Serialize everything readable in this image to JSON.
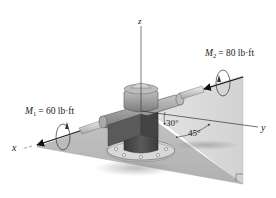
{
  "figure": {
    "axes": {
      "x_label": "x",
      "y_label": "y",
      "z_label": "z"
    },
    "moments": [
      {
        "symbol": "M",
        "subscript": "1",
        "equals": "= 60 lb·ft",
        "value": 60,
        "unit": "lb·ft",
        "axis": "x"
      },
      {
        "symbol": "M",
        "subscript": "2",
        "equals": "= 80 lb·ft",
        "value": 80,
        "unit": "lb·ft"
      }
    ],
    "angles": [
      {
        "label": "30°",
        "value": 30
      },
      {
        "label": "45°",
        "value": 45
      }
    ],
    "colors": {
      "plane_vertical": "#d9d9d9",
      "plane_floor": "#bdbdbd",
      "housing": "#9a9a9a",
      "housing_dark": "#5e5e5e",
      "post": "#4a4a4a",
      "shaft": "#cfcfcf",
      "axis_line": "#222222"
    }
  }
}
